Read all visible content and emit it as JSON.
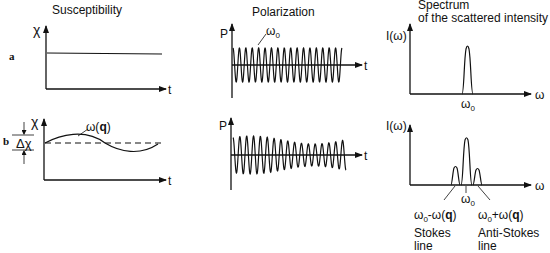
{
  "titles": {
    "susceptibility": "Susceptibility",
    "polarization": "Polarization",
    "spectrum_line1": "Spectrum",
    "spectrum_line2": "of the scattered intensity"
  },
  "row_labels": {
    "a": "a",
    "b": "b"
  },
  "axes": {
    "chi": "χ",
    "t": "t",
    "P": "P",
    "I_omega": "I(ω)",
    "omega": "ω"
  },
  "annotations": {
    "omega_q": "ω(q)",
    "omega_0": "ω₀",
    "delta_chi": "Δχ",
    "stokes_freq": "ω₀-ω(q)",
    "anti_stokes_freq": "ω₀+ω(q)",
    "stokes_line_1": "Stokes",
    "stokes_line_2": "line",
    "anti_stokes_line_1": "Anti-Stokes",
    "anti_stokes_line_2": "line"
  },
  "panels": [
    {
      "row": "a",
      "column": "susceptibility",
      "description": "constant susceptibility vs time"
    },
    {
      "row": "a",
      "column": "polarization",
      "description": "constant-amplitude oscillation at ω0"
    },
    {
      "row": "a",
      "column": "spectrum",
      "description": "single peak at ω0"
    },
    {
      "row": "b",
      "column": "susceptibility",
      "description": "susceptibility oscillating with ω(q) around mean, amplitude Δχ"
    },
    {
      "row": "b",
      "column": "polarization",
      "description": "amplitude-modulated oscillation"
    },
    {
      "row": "b",
      "column": "spectrum",
      "description": "central peak at ω0 with Stokes and Anti-Stokes sidebands"
    }
  ]
}
